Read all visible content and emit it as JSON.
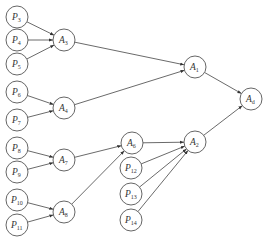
{
  "diagram": {
    "type": "hierarchy-graph",
    "nodes": [
      {
        "id": "P3",
        "letter": "P",
        "sub": "3",
        "x": 17,
        "y": 17
      },
      {
        "id": "P4",
        "letter": "P",
        "sub": "4",
        "x": 17,
        "y": 40
      },
      {
        "id": "P5",
        "letter": "P",
        "sub": "5",
        "x": 17,
        "y": 64
      },
      {
        "id": "P6",
        "letter": "P",
        "sub": "6",
        "x": 17,
        "y": 92
      },
      {
        "id": "P7",
        "letter": "P",
        "sub": "7",
        "x": 17,
        "y": 120
      },
      {
        "id": "P8",
        "letter": "P",
        "sub": "8",
        "x": 17,
        "y": 148
      },
      {
        "id": "P9",
        "letter": "P",
        "sub": "9",
        "x": 17,
        "y": 172
      },
      {
        "id": "P10",
        "letter": "P",
        "sub": "10",
        "x": 17,
        "y": 200
      },
      {
        "id": "P11",
        "letter": "P",
        "sub": "11",
        "x": 17,
        "y": 225
      },
      {
        "id": "A3",
        "letter": "A",
        "sub": "3",
        "x": 64,
        "y": 40
      },
      {
        "id": "A4",
        "letter": "A",
        "sub": "4",
        "x": 64,
        "y": 108
      },
      {
        "id": "A7",
        "letter": "A",
        "sub": "7",
        "x": 64,
        "y": 160
      },
      {
        "id": "A8",
        "letter": "A",
        "sub": "8",
        "x": 64,
        "y": 212
      },
      {
        "id": "A6",
        "letter": "A",
        "sub": "6",
        "x": 132,
        "y": 143
      },
      {
        "id": "P12",
        "letter": "P",
        "sub": "12",
        "x": 131,
        "y": 168
      },
      {
        "id": "P13",
        "letter": "P",
        "sub": "13",
        "x": 131,
        "y": 194
      },
      {
        "id": "P14",
        "letter": "P",
        "sub": "14",
        "x": 131,
        "y": 220
      },
      {
        "id": "A1",
        "letter": "A",
        "sub": "1",
        "x": 195,
        "y": 67
      },
      {
        "id": "A2",
        "letter": "A",
        "sub": "2",
        "x": 195,
        "y": 142
      },
      {
        "id": "Ad",
        "letter": "A",
        "sub": "d",
        "x": 251,
        "y": 99
      }
    ],
    "edges": [
      [
        "P3",
        "A3"
      ],
      [
        "P4",
        "A3"
      ],
      [
        "P5",
        "A3"
      ],
      [
        "P6",
        "A4"
      ],
      [
        "P7",
        "A4"
      ],
      [
        "P8",
        "A7"
      ],
      [
        "P9",
        "A7"
      ],
      [
        "P10",
        "A8"
      ],
      [
        "P11",
        "A8"
      ],
      [
        "A3",
        "A1"
      ],
      [
        "A4",
        "A1"
      ],
      [
        "A7",
        "A6"
      ],
      [
        "A8",
        "A6"
      ],
      [
        "A6",
        "A2"
      ],
      [
        "P12",
        "A2"
      ],
      [
        "P13",
        "A2"
      ],
      [
        "P14",
        "A2"
      ],
      [
        "A1",
        "Ad"
      ],
      [
        "A2",
        "Ad"
      ]
    ],
    "node_radius": 11,
    "colors": {
      "stroke": "#555555",
      "edge": "#444444",
      "text": "#333333",
      "background": "#ffffff"
    }
  }
}
